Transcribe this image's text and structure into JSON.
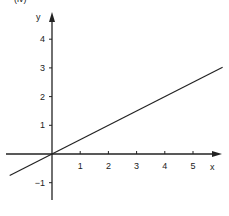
{
  "panel_label": "(iv)",
  "chart_data": {
    "type": "line",
    "title": "",
    "xlabel": "x",
    "ylabel": "y",
    "xlim": [
      -1.5,
      6.1
    ],
    "ylim": [
      -1.6,
      4.9
    ],
    "grid": false,
    "legend": null,
    "x_ticks": [
      1,
      2,
      3,
      4,
      5
    ],
    "y_ticks": [
      -1,
      1,
      2,
      3,
      4
    ],
    "x_tick_labels": [
      "1",
      "2",
      "3",
      "4",
      "5"
    ],
    "y_tick_labels": [
      "−1",
      "1",
      "2",
      "3",
      "4"
    ],
    "series": [
      {
        "name": "y = 0.5x",
        "x": [
          -1.5,
          6.05
        ],
        "y": [
          -0.75,
          3.02
        ]
      }
    ],
    "color": "#222222"
  }
}
